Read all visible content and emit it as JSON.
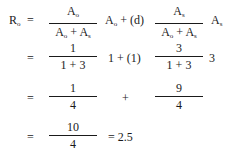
{
  "equation": {
    "line1": {
      "lhs_base": "R",
      "lhs_sub": "o",
      "equals": "=",
      "frac1": {
        "num_base": "A",
        "num_sub": "o",
        "den1_base": "A",
        "den1_sub": "o",
        "den_op": "+",
        "den2_base": "A",
        "den2_sub": "s"
      },
      "mid1_base": "A",
      "mid1_sub": "o",
      "mid_op": "+",
      "mid_coef": "(d)",
      "frac2": {
        "num_base": "A",
        "num_sub": "s",
        "den1_base": "A",
        "den1_sub": "o",
        "den_op": "+",
        "den2_base": "A",
        "den2_sub": "s"
      },
      "tail_base": "A",
      "tail_sub": "s"
    },
    "line2": {
      "equals": "=",
      "frac1": {
        "num": "1",
        "den": "1 + 3"
      },
      "mid": "1 + (1)",
      "frac2": {
        "num": "3",
        "den": "1 + 3"
      },
      "tail": "3"
    },
    "line3": {
      "equals": "=",
      "frac1": {
        "num": "1",
        "den": "4"
      },
      "op": "+",
      "frac2": {
        "num": "9",
        "den": "4"
      }
    },
    "line4": {
      "equals": "=",
      "frac1": {
        "num": "10",
        "den": "4"
      },
      "result": "= 2.5"
    }
  }
}
